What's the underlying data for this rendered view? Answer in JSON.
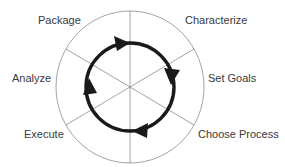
{
  "diagram": {
    "type": "cycle",
    "center": [
      130,
      87
    ],
    "outer_circle": {
      "rx": 74,
      "ry": 76,
      "stroke": "#8a8a8a"
    },
    "inner_ring": {
      "rx": 44,
      "ry": 44,
      "stroke": "#1a1a1a",
      "direction": "clockwise"
    },
    "divider_angles_deg": [
      90,
      30,
      -30
    ],
    "steps": [
      {
        "id": "characterize",
        "label": "Characterize",
        "x": 185,
        "y": 14
      },
      {
        "id": "set-goals",
        "label": "Set Goals",
        "x": 208,
        "y": 72
      },
      {
        "id": "choose-process",
        "label": "Choose Process",
        "x": 198,
        "y": 143
      },
      {
        "id": "execute",
        "label": "Execute",
        "x": 24,
        "y": 128
      },
      {
        "id": "analyze",
        "label": "Analyze",
        "x": 12,
        "y": 72
      },
      {
        "id": "package",
        "label": "Package",
        "x": 38,
        "y": 14
      }
    ],
    "arrows": [
      {
        "position": "top",
        "x": 117,
        "y": 44
      },
      {
        "position": "right",
        "x": 172,
        "y": 76
      },
      {
        "position": "bottom",
        "x": 141,
        "y": 129
      },
      {
        "position": "left",
        "x": 89,
        "y": 97
      }
    ]
  }
}
